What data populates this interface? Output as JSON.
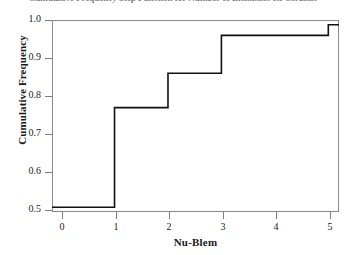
{
  "chart_data": {
    "type": "line",
    "subtype": "step-ecdf",
    "title": "Cumulative Frequency Step Function for Number of Blemishes on Ceramic",
    "xlabel": "Nu-Blem",
    "ylabel": "Cumulative Frequency",
    "xlim": [
      -0.17,
      5.2
    ],
    "ylim": [
      0.487,
      1.013
    ],
    "grid": false,
    "legend": null,
    "x_ticks": [
      0,
      1,
      2,
      3,
      4,
      5
    ],
    "x_tick_labels": [
      "0",
      "1",
      "2",
      "3",
      "4",
      "5"
    ],
    "y_ticks": [
      0.5,
      0.6,
      0.7,
      0.8,
      0.9,
      1.0
    ],
    "y_tick_labels": [
      "0.5",
      "0.6",
      "0.7",
      "0.8",
      "0.9",
      "1.0"
    ],
    "x": [
      0,
      1,
      2,
      3,
      4,
      5
    ],
    "values": [
      0.5,
      0.773,
      0.867,
      0.971,
      0.971,
      1.0
    ],
    "series": [
      {
        "name": "Cumulative Frequency",
        "color": "#111111",
        "line_width": 1.6,
        "step_mode": "post",
        "points": [
          {
            "x": 0,
            "y": 0.5
          },
          {
            "x": 1,
            "y": 0.773
          },
          {
            "x": 2,
            "y": 0.867
          },
          {
            "x": 3,
            "y": 0.971
          },
          {
            "x": 4,
            "y": 0.971
          },
          {
            "x": 5,
            "y": 1.0
          }
        ]
      }
    ],
    "annotations": []
  },
  "axes": {
    "y_title": "Cumulative Frequency",
    "x_title": "Nu-Blem",
    "y_tick_labels": [
      "1.0",
      "0.9",
      "0.8",
      "0.7",
      "0.6",
      "0.5"
    ],
    "x_tick_labels": [
      "0",
      "1",
      "2",
      "3",
      "4",
      "5"
    ]
  },
  "header": {
    "title": "Cumulative Frequency Step Function for Number of Blemishes on Ceramic"
  }
}
